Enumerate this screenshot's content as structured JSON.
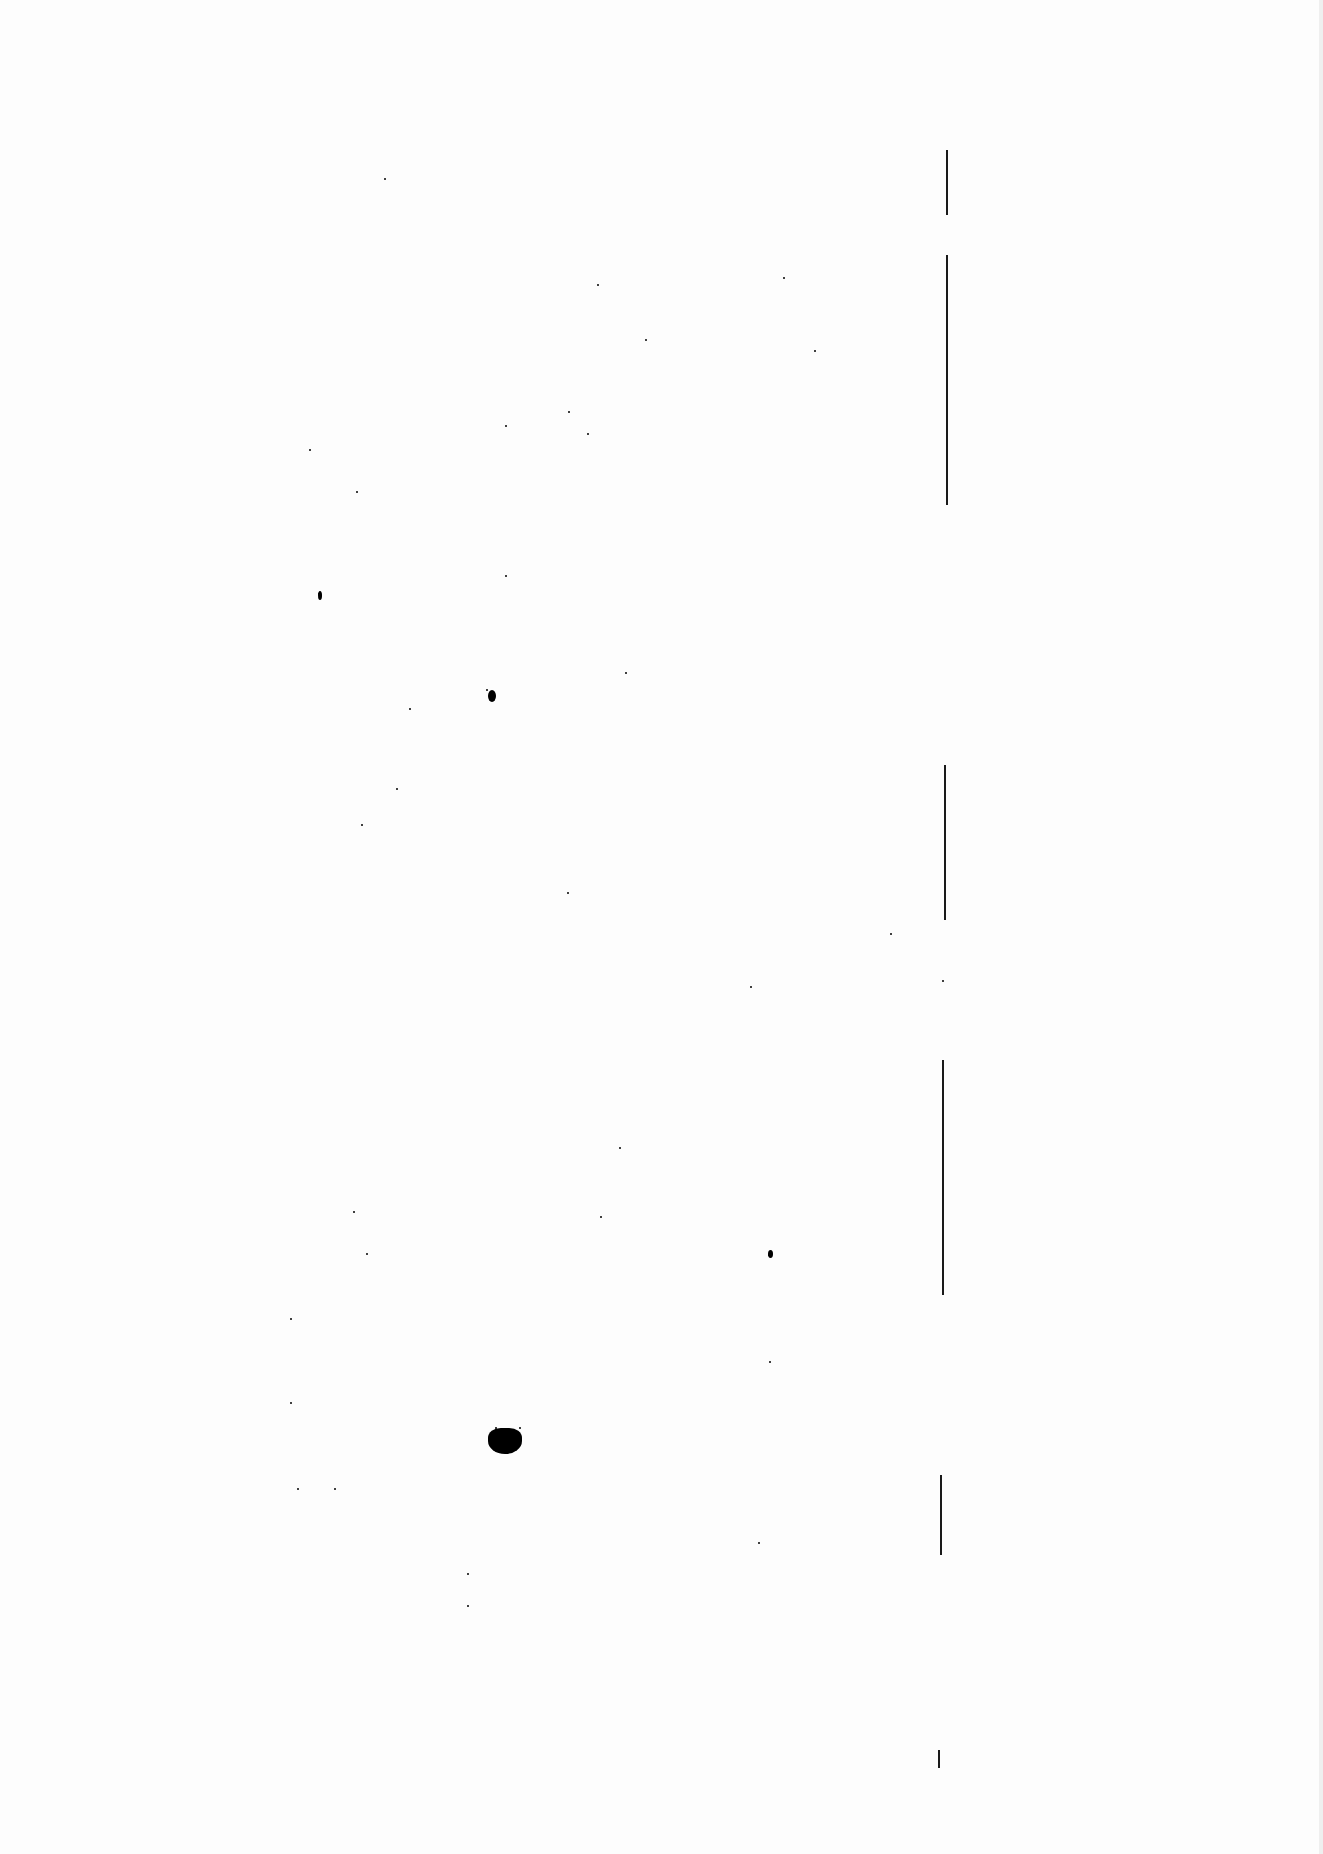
{
  "document": {
    "type": "scanned-blank-page",
    "background_color": "#fdfdfd",
    "ink_color": "#000000",
    "text": "",
    "margin_line_segments": [
      {
        "x": 946,
        "y1": 150,
        "y2": 215
      },
      {
        "x": 946,
        "y1": 255,
        "y2": 505
      },
      {
        "x": 944,
        "y1": 765,
        "y2": 920
      },
      {
        "x": 942,
        "y1": 1060,
        "y2": 1295
      },
      {
        "x": 940,
        "y1": 1475,
        "y2": 1555
      },
      {
        "x": 938,
        "y1": 1750,
        "y2": 1768
      }
    ],
    "specks": [
      [
        384,
        178
      ],
      [
        783,
        277
      ],
      [
        597,
        284
      ],
      [
        645,
        339
      ],
      [
        814,
        350
      ],
      [
        568,
        411
      ],
      [
        505,
        425
      ],
      [
        587,
        433
      ],
      [
        309,
        449
      ],
      [
        356,
        491
      ],
      [
        505,
        575
      ],
      [
        318,
        593
      ],
      [
        486,
        689
      ],
      [
        625,
        672
      ],
      [
        409,
        708
      ],
      [
        396,
        788
      ],
      [
        361,
        824
      ],
      [
        567,
        892
      ],
      [
        890,
        933
      ],
      [
        750,
        986
      ],
      [
        942,
        980
      ],
      [
        619,
        1147
      ],
      [
        353,
        1211
      ],
      [
        600,
        1216
      ],
      [
        366,
        1253
      ],
      [
        290,
        1318
      ],
      [
        768,
        1254
      ],
      [
        769,
        1361
      ],
      [
        290,
        1402
      ],
      [
        297,
        1488
      ],
      [
        334,
        1488
      ],
      [
        758,
        1542
      ],
      [
        467,
        1573
      ],
      [
        467,
        1605
      ],
      [
        495,
        1427
      ],
      [
        519,
        1427
      ]
    ],
    "large_dots": [
      {
        "x": 488,
        "y": 690,
        "w": 8,
        "h": 12
      },
      {
        "x": 318,
        "y": 591,
        "w": 4,
        "h": 9
      },
      {
        "x": 768,
        "y": 1250,
        "w": 5,
        "h": 8
      }
    ],
    "blob": {
      "x": 488,
      "y": 1428,
      "w": 34,
      "h": 26
    }
  }
}
